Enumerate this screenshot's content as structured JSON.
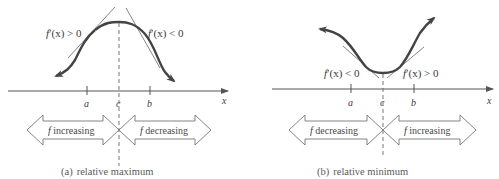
{
  "panels": [
    {
      "id": "a",
      "type": "relative-maximum",
      "axis_label": "x",
      "ticks": [
        "a",
        "c",
        "b"
      ],
      "derivative_labels": {
        "left": {
          "f": "f",
          "rest": "′(x) > 0"
        },
        "right": {
          "f": "f",
          "rest": "′(x) < 0"
        }
      },
      "arrows": {
        "left": {
          "f": "f",
          "text": " increasing"
        },
        "right": {
          "f": "f",
          "text": " decreasing"
        }
      },
      "caption": {
        "marker": "(a)",
        "text": "relative maximum"
      }
    },
    {
      "id": "b",
      "type": "relative-minimum",
      "axis_label": "x",
      "ticks": [
        "a",
        "c",
        "b"
      ],
      "derivative_labels": {
        "left": {
          "f": "f",
          "rest": "′(x) < 0"
        },
        "right": {
          "f": "f",
          "rest": "′(x) > 0"
        }
      },
      "arrows": {
        "left": {
          "f": "f",
          "text": " decreasing"
        },
        "right": {
          "f": "f",
          "text": " increasing"
        }
      },
      "caption": {
        "marker": "(b)",
        "text": "relative minimum"
      }
    }
  ],
  "colors": {
    "curve": "#4a4a4a",
    "axis": "#555555",
    "tangent": "#666666",
    "arrow_outline": "#707070",
    "text": "#3a3a3a"
  }
}
